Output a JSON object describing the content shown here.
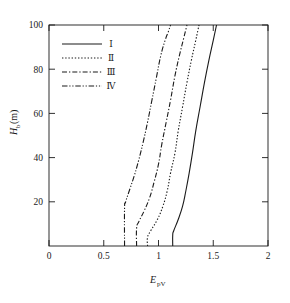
{
  "chart_data": {
    "type": "line",
    "title": "",
    "xlabel": "E_pV",
    "xlabel_base": "E",
    "xlabel_sub": "pV",
    "ylabel": "H_b(m)",
    "ylabel_base": "H",
    "ylabel_sub": "b",
    "ylabel_unit": "(m)",
    "xlim": [
      0,
      2
    ],
    "ylim": [
      0,
      100
    ],
    "xticks": [
      0,
      0.5,
      1,
      1.5,
      2
    ],
    "xticklabels": [
      "0",
      "0.5",
      "1",
      "1.5",
      "2"
    ],
    "yticks": [
      20,
      40,
      60,
      80,
      100
    ],
    "yticklabels": [
      "20",
      "40",
      "60",
      "80",
      "100"
    ],
    "grid": false,
    "legend_position": "upper-left",
    "legend_entries": [
      {
        "label": "Ⅰ",
        "style": "solid"
      },
      {
        "label": "Ⅱ",
        "style": "dotted"
      },
      {
        "label": "Ⅲ",
        "style": "dash-dot"
      },
      {
        "label": "Ⅳ",
        "style": "dash-dot-dot"
      }
    ],
    "series": [
      {
        "name": "Ⅰ",
        "style": "solid",
        "x": [
          1.13,
          1.13,
          1.14,
          1.18,
          1.22,
          1.25,
          1.28,
          1.31,
          1.34,
          1.38,
          1.42,
          1.46,
          1.5,
          1.53
        ],
        "y": [
          0,
          5,
          7,
          12,
          18,
          25,
          33,
          42,
          52,
          63,
          74,
          84,
          93,
          100
        ]
      },
      {
        "name": "Ⅱ",
        "style": "dotted",
        "x": [
          0.9,
          0.9,
          0.93,
          0.99,
          1.04,
          1.08,
          1.11,
          1.15,
          1.18,
          1.22,
          1.26,
          1.3,
          1.34,
          1.37
        ],
        "y": [
          0,
          4,
          7,
          12,
          18,
          25,
          33,
          42,
          52,
          63,
          74,
          84,
          93,
          100
        ]
      },
      {
        "name": "Ⅲ",
        "style": "dash-dot",
        "x": [
          0.8,
          0.8,
          0.82,
          0.87,
          0.92,
          0.96,
          1.0,
          1.03,
          1.07,
          1.11,
          1.15,
          1.19,
          1.23,
          1.26
        ],
        "y": [
          0,
          8,
          11,
          16,
          22,
          29,
          37,
          46,
          56,
          66,
          77,
          86,
          94,
          100
        ]
      },
      {
        "name": "Ⅳ",
        "style": "dash-dot-dot",
        "x": [
          0.69,
          0.69,
          0.7,
          0.74,
          0.78,
          0.82,
          0.86,
          0.9,
          0.94,
          0.98,
          1.02,
          1.06,
          1.09,
          1.11
        ],
        "y": [
          0,
          17,
          20,
          26,
          32,
          39,
          47,
          56,
          66,
          76,
          86,
          93,
          97,
          100
        ]
      }
    ]
  }
}
